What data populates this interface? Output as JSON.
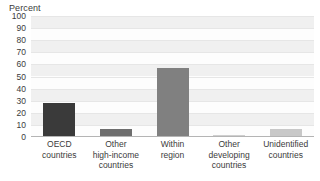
{
  "chart_data": {
    "type": "bar",
    "title": "",
    "subtitle": "",
    "xlabel": "",
    "ylabel": "Percent",
    "ylim": [
      0,
      100
    ],
    "yticks": [
      100,
      90,
      80,
      70,
      60,
      50,
      40,
      30,
      20,
      10,
      0
    ],
    "ytick_labels": [
      "100",
      "90",
      "80",
      "70",
      "60",
      "50",
      "40",
      "30",
      "20",
      "10",
      "0"
    ],
    "grid": true,
    "grid_orientation": "horizontal",
    "legend": false,
    "legend_position": "none",
    "categories": [
      "OECD\ncountries",
      "Other\nhigh-income\ncountries",
      "Within\nregion",
      "Other\ndeveloping\ncountries",
      "Unidentified\ncountries"
    ],
    "values": [
      28,
      7,
      57,
      2,
      7
    ],
    "bar_colors": [
      "#3a3a3a",
      "#6e6e6e",
      "#808080",
      "#cfcfcf",
      "#c8c8c8"
    ],
    "bars": [
      {
        "category": "OECD countries",
        "value": 28,
        "color": "#3a3a3a"
      },
      {
        "category": "Other high-income countries",
        "value": 7,
        "color": "#6e6e6e"
      },
      {
        "category": "Within region",
        "value": 57,
        "color": "#808080"
      },
      {
        "category": "Other developing countries",
        "value": 2,
        "color": "#cfcfcf"
      },
      {
        "category": "Unidentified countries",
        "value": 7,
        "color": "#c8c8c8"
      }
    ]
  },
  "style": {
    "plot_background": "#fdfdfd",
    "band_color": "#f0f0f0",
    "gridline_color": "#e6e6e6",
    "axis_color": "#b4b4b4",
    "text_color": "#3b3b3b",
    "page_background": "#ffffff"
  }
}
